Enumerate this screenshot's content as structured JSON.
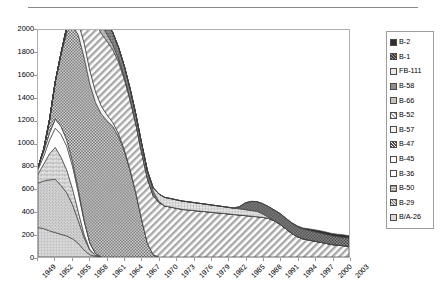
{
  "chart_data": {
    "type": "area",
    "stacked": true,
    "title": "",
    "xlabel": "",
    "ylabel": "",
    "ylim": [
      0,
      2000
    ],
    "ytick_step": 200,
    "yticks": [
      2000,
      1800,
      1600,
      1400,
      1200,
      1000,
      800,
      600,
      400,
      200,
      0
    ],
    "grid": false,
    "legend_position": "right",
    "x_first": 1949,
    "x_last": 2003,
    "xticks": [
      "1949",
      "1952",
      "1955",
      "1958",
      "1961",
      "1964",
      "1967",
      "1970",
      "1973",
      "1976",
      "1979",
      "1982",
      "1985",
      "1988",
      "1991",
      "1994",
      "1997",
      "2000",
      "2003"
    ],
    "x": [
      1949,
      1950,
      1951,
      1952,
      1953,
      1954,
      1955,
      1956,
      1957,
      1958,
      1959,
      1960,
      1961,
      1962,
      1963,
      1964,
      1965,
      1966,
      1967,
      1968,
      1969,
      1970,
      1971,
      1972,
      1973,
      1974,
      1975,
      1976,
      1977,
      1978,
      1979,
      1980,
      1981,
      1982,
      1983,
      1984,
      1985,
      1986,
      1987,
      1988,
      1989,
      1990,
      1991,
      1992,
      1993,
      1994,
      1995,
      1996,
      1997,
      1998,
      1999,
      2000,
      2001,
      2002,
      2003
    ],
    "series": [
      {
        "name": "B/A-26",
        "pattern": "grid-light",
        "color": "#d8d8d8",
        "values": [
          260,
          250,
          230,
          215,
          200,
          185,
          160,
          120,
          60,
          20,
          5,
          0,
          0,
          0,
          0,
          0,
          0,
          0,
          0,
          0,
          0,
          0,
          0,
          0,
          0,
          0,
          0,
          0,
          0,
          0,
          0,
          0,
          0,
          0,
          0,
          0,
          0,
          0,
          0,
          0,
          0,
          0,
          0,
          0,
          0,
          0,
          0,
          0,
          0,
          0,
          0,
          0,
          0,
          0,
          0
        ]
      },
      {
        "name": "B-29",
        "pattern": "dots-fine",
        "color": "#c9c9c9",
        "values": [
          390,
          420,
          450,
          470,
          430,
          380,
          300,
          200,
          110,
          40,
          10,
          0,
          0,
          0,
          0,
          0,
          0,
          0,
          0,
          0,
          0,
          0,
          0,
          0,
          0,
          0,
          0,
          0,
          0,
          0,
          0,
          0,
          0,
          0,
          0,
          0,
          0,
          0,
          0,
          0,
          0,
          0,
          0,
          0,
          0,
          0,
          0,
          0,
          0,
          0,
          0,
          0,
          0,
          0,
          0
        ]
      },
      {
        "name": "B-50",
        "pattern": "brick",
        "color": "#dcdcdc",
        "values": [
          80,
          150,
          230,
          280,
          250,
          200,
          140,
          80,
          30,
          5,
          0,
          0,
          0,
          0,
          0,
          0,
          0,
          0,
          0,
          0,
          0,
          0,
          0,
          0,
          0,
          0,
          0,
          0,
          0,
          0,
          0,
          0,
          0,
          0,
          0,
          0,
          0,
          0,
          0,
          0,
          0,
          0,
          0,
          0,
          0,
          0,
          0,
          0,
          0,
          0,
          0,
          0,
          0,
          0,
          0
        ]
      },
      {
        "name": "B-36",
        "pattern": "solid-white",
        "color": "#ffffff",
        "values": [
          40,
          70,
          120,
          170,
          200,
          210,
          200,
          170,
          120,
          60,
          15,
          0,
          0,
          0,
          0,
          0,
          0,
          0,
          0,
          0,
          0,
          0,
          0,
          0,
          0,
          0,
          0,
          0,
          0,
          0,
          0,
          0,
          0,
          0,
          0,
          0,
          0,
          0,
          0,
          0,
          0,
          0,
          0,
          0,
          0,
          0,
          0,
          0,
          0,
          0,
          0,
          0,
          0,
          0,
          0
        ]
      },
      {
        "name": "B-45",
        "pattern": "solid-white2",
        "color": "#fcfcfc",
        "values": [
          20,
          40,
          60,
          80,
          70,
          55,
          40,
          25,
          10,
          0,
          0,
          0,
          0,
          0,
          0,
          0,
          0,
          0,
          0,
          0,
          0,
          0,
          0,
          0,
          0,
          0,
          0,
          0,
          0,
          0,
          0,
          0,
          0,
          0,
          0,
          0,
          0,
          0,
          0,
          0,
          0,
          0,
          0,
          0,
          0,
          0,
          0,
          0,
          0,
          0,
          0,
          0,
          0,
          0,
          0
        ]
      },
      {
        "name": "B-47",
        "pattern": "checker",
        "color": "#8f8f8f",
        "values": [
          0,
          20,
          120,
          330,
          640,
          950,
          1200,
          1360,
          1430,
          1400,
          1330,
          1260,
          1200,
          1150,
          1060,
          930,
          760,
          560,
          330,
          120,
          20,
          0,
          0,
          0,
          0,
          0,
          0,
          0,
          0,
          0,
          0,
          0,
          0,
          0,
          0,
          0,
          0,
          0,
          0,
          0,
          0,
          0,
          0,
          0,
          0,
          0,
          0,
          0,
          0,
          0,
          0,
          0,
          0,
          0,
          0
        ]
      },
      {
        "name": "B-57",
        "pattern": "solid-light",
        "color": "#f2f2f2",
        "values": [
          0,
          0,
          0,
          0,
          5,
          30,
          70,
          110,
          130,
          120,
          95,
          70,
          50,
          35,
          25,
          15,
          10,
          5,
          0,
          0,
          0,
          0,
          0,
          0,
          0,
          0,
          0,
          0,
          0,
          0,
          0,
          0,
          0,
          0,
          0,
          0,
          0,
          0,
          0,
          0,
          0,
          0,
          0,
          0,
          0,
          0,
          0,
          0,
          0,
          0,
          0,
          0,
          0,
          0,
          0
        ]
      },
      {
        "name": "B-52",
        "pattern": "diagonal",
        "color": "#e0e0e0",
        "values": [
          0,
          0,
          0,
          0,
          0,
          20,
          90,
          230,
          380,
          520,
          600,
          640,
          650,
          640,
          630,
          620,
          610,
          600,
          590,
          570,
          520,
          480,
          450,
          440,
          430,
          420,
          415,
          410,
          405,
          400,
          395,
          390,
          385,
          380,
          375,
          370,
          365,
          360,
          355,
          350,
          340,
          320,
          290,
          250,
          210,
          180,
          160,
          150,
          140,
          130,
          120,
          110,
          105,
          100,
          95
        ]
      },
      {
        "name": "B-66",
        "pattern": "grid-mid",
        "color": "#bdbdbd",
        "values": [
          0,
          0,
          0,
          0,
          0,
          0,
          10,
          40,
          80,
          100,
          95,
          80,
          60,
          45,
          30,
          20,
          12,
          6,
          0,
          0,
          0,
          0,
          0,
          0,
          0,
          0,
          0,
          0,
          0,
          0,
          0,
          0,
          0,
          0,
          0,
          0,
          0,
          0,
          0,
          0,
          0,
          0,
          0,
          0,
          0,
          0,
          0,
          0,
          0,
          0,
          0,
          0,
          0,
          0,
          0
        ]
      },
      {
        "name": "B-58",
        "pattern": "grid-dark",
        "color": "#9e9e9e",
        "values": [
          0,
          0,
          0,
          0,
          0,
          0,
          0,
          0,
          0,
          10,
          60,
          100,
          110,
          105,
          100,
          95,
          90,
          85,
          80,
          70,
          40,
          10,
          0,
          0,
          0,
          0,
          0,
          0,
          0,
          0,
          0,
          0,
          0,
          0,
          0,
          0,
          0,
          0,
          0,
          0,
          0,
          0,
          0,
          0,
          0,
          0,
          0,
          0,
          0,
          0,
          0,
          0,
          0,
          0,
          0
        ]
      },
      {
        "name": "FB-111",
        "pattern": "grid-soft",
        "color": "#cfcfcf",
        "values": [
          0,
          0,
          0,
          0,
          0,
          0,
          0,
          0,
          0,
          0,
          0,
          0,
          0,
          0,
          0,
          0,
          0,
          0,
          0,
          0,
          30,
          65,
          75,
          75,
          74,
          73,
          72,
          70,
          68,
          66,
          64,
          62,
          60,
          58,
          56,
          54,
          52,
          50,
          48,
          30,
          10,
          0,
          0,
          0,
          0,
          0,
          0,
          0,
          0,
          0,
          0,
          0,
          0,
          0,
          0
        ]
      },
      {
        "name": "B-1",
        "pattern": "dots-dark",
        "color": "#7d7d7d",
        "values": [
          0,
          0,
          0,
          0,
          0,
          0,
          0,
          0,
          0,
          0,
          0,
          0,
          0,
          0,
          0,
          0,
          0,
          0,
          0,
          0,
          0,
          0,
          0,
          0,
          0,
          0,
          0,
          0,
          0,
          0,
          0,
          0,
          0,
          0,
          0,
          20,
          60,
          80,
          85,
          90,
          95,
          95,
          94,
          93,
          92,
          90,
          88,
          86,
          84,
          82,
          80,
          78,
          76,
          74,
          72
        ]
      },
      {
        "name": "B-2",
        "pattern": "solid-dark",
        "color": "#2e2e2e",
        "values": [
          0,
          0,
          0,
          0,
          0,
          0,
          0,
          0,
          0,
          0,
          0,
          0,
          0,
          0,
          0,
          0,
          0,
          0,
          0,
          0,
          0,
          0,
          0,
          0,
          0,
          0,
          0,
          0,
          0,
          0,
          0,
          0,
          0,
          0,
          0,
          0,
          0,
          0,
          0,
          0,
          0,
          0,
          0,
          0,
          2,
          5,
          8,
          12,
          16,
          19,
          20,
          20,
          20,
          21,
          21
        ]
      }
    ],
    "peak_total": 1800,
    "peak_years": [
      1959,
      1962
    ]
  },
  "legend": {
    "items": [
      {
        "label": "B-2",
        "pattern": "solid-dark"
      },
      {
        "label": "B-1",
        "pattern": "dots-dark"
      },
      {
        "label": "FB-111",
        "pattern": "grid-soft"
      },
      {
        "label": "B-58",
        "pattern": "grid-dark"
      },
      {
        "label": "B-66",
        "pattern": "grid-mid"
      },
      {
        "label": "B-52",
        "pattern": "diagonal"
      },
      {
        "label": "B-57",
        "pattern": "solid-light"
      },
      {
        "label": "B-47",
        "pattern": "checker"
      },
      {
        "label": "B-45",
        "pattern": "solid-white2"
      },
      {
        "label": "B-36",
        "pattern": "solid-white"
      },
      {
        "label": "B-50",
        "pattern": "brick"
      },
      {
        "label": "B-29",
        "pattern": "dots-fine"
      },
      {
        "label": "B/A-26",
        "pattern": "grid-light"
      }
    ]
  }
}
